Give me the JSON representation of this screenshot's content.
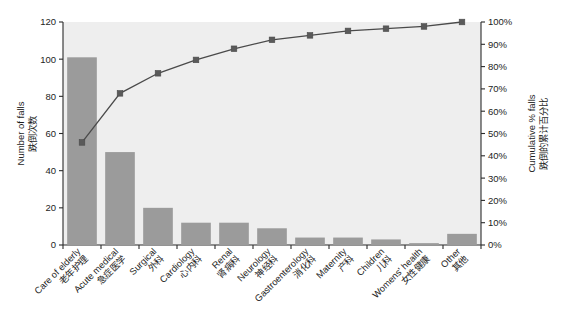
{
  "chart_data": {
    "type": "bar",
    "title": "",
    "subtitle": "",
    "categories": [
      "Care of elderly",
      "Acute medical",
      "Surgical",
      "Cardiology",
      "Renal",
      "Neurology",
      "Gastroenterology",
      "Maternity",
      "Children",
      "Womens' health",
      "Other"
    ],
    "categories_zh": [
      "老年护理",
      "急症医学",
      "外科",
      "心内科",
      "肾病科",
      "神经科",
      "消化科",
      "产科",
      "儿科",
      "女性健康",
      "其他"
    ],
    "series": [
      {
        "name": "Number of falls",
        "type": "bar",
        "axis": "left",
        "values": [
          101,
          50,
          20,
          12,
          12,
          9,
          4,
          4,
          3,
          1,
          6
        ]
      },
      {
        "name": "Cumulative % falls",
        "type": "line",
        "axis": "right",
        "values": [
          46,
          68,
          77,
          83,
          88,
          92,
          94,
          96,
          97,
          98,
          100
        ]
      }
    ],
    "xlabel": "",
    "ylabel": "Number of falls",
    "ylabel_zh": "跌倒次数",
    "y2label": "Cumulative % falls",
    "y2label_zh": "跌倒的累计百分比",
    "ylim": [
      0,
      120
    ],
    "y2lim": [
      0,
      100
    ],
    "yticks": [
      "0",
      "20",
      "40",
      "60",
      "80",
      "100",
      "120"
    ],
    "y2ticks": [
      "0%",
      "10%",
      "20%",
      "30%",
      "40%",
      "50%",
      "60%",
      "70%",
      "80%",
      "90%",
      "100%"
    ],
    "grid": false,
    "legend": "none",
    "colors": {
      "bar_fill": "#9b9b9b",
      "line_stroke": "#4a4a4a",
      "marker_fill": "#5a5a5a",
      "plot_background": "#eeeeee",
      "axis": "#2b2b2b",
      "text": "#1d1d1d"
    }
  }
}
